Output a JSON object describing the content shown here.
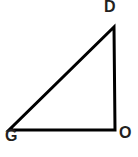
{
  "figure": {
    "name": "right-triangle-dog",
    "background_color": "#ffffff",
    "stroke_color": "#000000",
    "stroke_width_px": 3,
    "label_color": "#231f20",
    "canvas": {
      "width": 138,
      "height": 157
    }
  },
  "labels": {
    "apex": "D",
    "right_angle": "O",
    "left_base": "G"
  },
  "chart_data": {
    "type": "diagram",
    "shape": "right triangle",
    "title": "",
    "vertices": [
      {
        "label": "D",
        "x": 114,
        "y": 27,
        "label_x": 110,
        "label_y": 13,
        "angle_marked": false
      },
      {
        "label": "O",
        "x": 115,
        "y": 130,
        "label_x": 125,
        "label_y": 139,
        "angle_marked": false
      },
      {
        "label": "G",
        "x": 9,
        "y": 130,
        "label_x": 11,
        "label_y": 142,
        "angle_marked": false
      }
    ],
    "edges": [
      {
        "from": "D",
        "to": "O",
        "name": "vertical-leg"
      },
      {
        "from": "O",
        "to": "G",
        "name": "horizontal-leg"
      },
      {
        "from": "G",
        "to": "D",
        "name": "hypotenuse"
      }
    ],
    "right_angle_at": "O",
    "grid": false,
    "legend": false
  }
}
